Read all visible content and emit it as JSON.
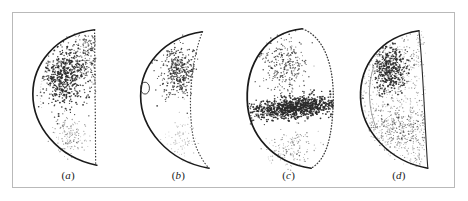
{
  "figure": {
    "type": "scientific-figure",
    "background_color": "#ffffff",
    "frame": {
      "border_color": "#b9b9b9",
      "border_width_px": 1,
      "x": 12,
      "y": 12,
      "width": 443,
      "height": 176
    },
    "outline_color": "#1a1a1a",
    "point_color": "#2a2a2a",
    "panel_count": 4
  },
  "panels": [
    {
      "id": "a",
      "label": "(a)",
      "label_open": "(",
      "label_letter": "a",
      "label_close": ")",
      "shape": "half-lens",
      "left_boundary": "solid-arc",
      "right_boundary": "dotted-vertical",
      "clusters": [
        {
          "name": "primary-dense-cluster",
          "position": "upper-center",
          "density": "high",
          "cx": 0.46,
          "cy": 0.37,
          "rx": 0.17,
          "ry": 0.15,
          "count": 520
        },
        {
          "name": "upper-right-stipple",
          "position": "upper-right",
          "density": "medium",
          "cx": 0.68,
          "cy": 0.26,
          "rx": 0.2,
          "ry": 0.17,
          "count": 260
        },
        {
          "name": "secondary-faint-cluster",
          "position": "lower-center",
          "density": "low",
          "cx": 0.52,
          "cy": 0.71,
          "rx": 0.14,
          "ry": 0.1,
          "count": 150
        }
      ]
    },
    {
      "id": "b",
      "label": "(b)",
      "label_open": "(",
      "label_letter": "b",
      "label_close": ")",
      "shape": "crescent",
      "left_boundary": "solid-arc",
      "right_boundary": "dotted-inner-arc",
      "marker": "small-open-ellipse-on-left-arc",
      "clusters": [
        {
          "name": "primary-cluster",
          "position": "upper-center",
          "density": "medium-high",
          "cx": 0.5,
          "cy": 0.34,
          "rx": 0.15,
          "ry": 0.13,
          "count": 380
        },
        {
          "name": "faint-lower-cluster",
          "position": "lower-center",
          "density": "very-low",
          "cx": 0.52,
          "cy": 0.72,
          "rx": 0.14,
          "ry": 0.1,
          "count": 90
        }
      ]
    },
    {
      "id": "c",
      "label": "(c)",
      "label_open": "(",
      "label_letter": "c",
      "label_close": ")",
      "shape": "closed-oval",
      "left_boundary": "solid-arc",
      "right_boundary": "dotted-arc",
      "clusters": [
        {
          "name": "diffuse-upper-cluster",
          "position": "upper-center",
          "density": "medium",
          "cx": 0.46,
          "cy": 0.3,
          "rx": 0.18,
          "ry": 0.14,
          "count": 300
        },
        {
          "name": "dense-horizontal-band",
          "position": "mid-band-tilted",
          "density": "very-high",
          "cx": 0.55,
          "cy": 0.54,
          "rx": 0.4,
          "ry": 0.055,
          "count": 900
        },
        {
          "name": "lower-faint-scatter",
          "position": "lower-center",
          "density": "low",
          "cx": 0.52,
          "cy": 0.78,
          "rx": 0.22,
          "ry": 0.1,
          "count": 160
        }
      ]
    },
    {
      "id": "d",
      "label": "(d)",
      "label_open": "(",
      "label_letter": "d",
      "label_close": ")",
      "shape": "half-lens",
      "left_boundary": "solid-arc",
      "right_boundary": "solid-curved-edge",
      "clusters": [
        {
          "name": "background-stipple",
          "position": "whole-panel",
          "density": "low-uniform",
          "cx": 0.52,
          "cy": 0.5,
          "rx": 0.44,
          "ry": 0.46,
          "count": 620
        },
        {
          "name": "primary-dense-cluster",
          "position": "upper-left-center",
          "density": "high",
          "cx": 0.42,
          "cy": 0.33,
          "rx": 0.13,
          "ry": 0.12,
          "count": 420
        },
        {
          "name": "diffuse-lower-band",
          "position": "lower-middle",
          "density": "medium-low",
          "cx": 0.52,
          "cy": 0.66,
          "rx": 0.26,
          "ry": 0.1,
          "count": 240
        }
      ]
    }
  ],
  "chart_data": {
    "type": "scatter",
    "title": "",
    "xlabel": "",
    "ylabel": "",
    "grid": false,
    "legend": "none",
    "subplot_labels": [
      "(a)",
      "(b)",
      "(c)",
      "(d)"
    ],
    "series": [
      {
        "name": "(a) point density",
        "peak_density_location": "upper-center",
        "total_points": 930
      },
      {
        "name": "(b) point density",
        "peak_density_location": "upper-center",
        "total_points": 470
      },
      {
        "name": "(c) point density",
        "peak_density_location": "mid-horizontal-band",
        "total_points": 1360
      },
      {
        "name": "(d) point density",
        "peak_density_location": "upper-left-center",
        "total_points": 1280
      }
    ]
  }
}
